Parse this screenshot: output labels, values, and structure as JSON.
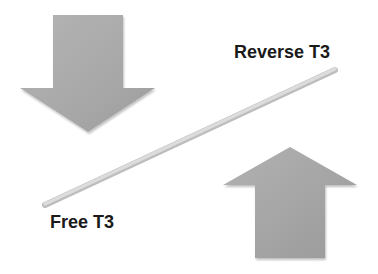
{
  "diagram": {
    "labels": {
      "reverse_t3": "Reverse T3",
      "free_t3": "Free T3"
    },
    "elements": {
      "down_arrow": {
        "direction": "down",
        "position": "top-left",
        "color": "#a9a9a9"
      },
      "up_arrow": {
        "direction": "up",
        "position": "bottom-right",
        "color": "#a9a9a9"
      },
      "balance_line": {
        "from": "Free T3",
        "to": "Reverse T3",
        "color": "#d0d0d0"
      }
    }
  }
}
